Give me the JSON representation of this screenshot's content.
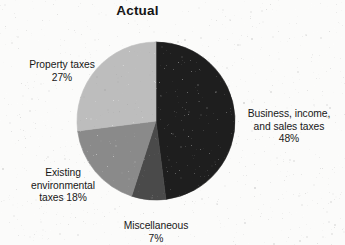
{
  "chart_title": "Actual",
  "background_color": "#fbfbfa",
  "text_color": "#171717",
  "labels": {
    "business": {
      "name": "Business, income,\nand sales taxes",
      "percent": "48%"
    },
    "miscellaneous": {
      "name": "Miscellaneous",
      "percent": "7%"
    },
    "environmental": {
      "name": "Existing\nenvironmental\ntaxes 18%",
      "percent": ""
    },
    "property": {
      "name": "Property taxes",
      "percent": "27%"
    }
  },
  "chart_data": {
    "type": "pie",
    "title": "Actual",
    "xlabel": "",
    "ylabel": "",
    "start_angle_deg": 0,
    "direction": "clockwise",
    "legend": "none",
    "grid": false,
    "labels_position": "outside",
    "categories": [
      "Business, income, and sales taxes",
      "Miscellaneous",
      "Existing environmental taxes",
      "Property taxes"
    ],
    "values": [
      48,
      7,
      18,
      27
    ],
    "value_suffix": "%",
    "colors": [
      "#1e1e1e",
      "#4a4a4a",
      "#8a8a8a",
      "#bdbdbd"
    ],
    "slices": [
      {
        "label": "Business, income, and sales taxes",
        "value": 48,
        "display": "48%",
        "color": "#1e1e1e",
        "start_deg": 0,
        "end_deg": 172.8
      },
      {
        "label": "Miscellaneous",
        "value": 7,
        "display": "7%",
        "color": "#4a4a4a",
        "start_deg": 172.8,
        "end_deg": 198.0
      },
      {
        "label": "Existing environmental taxes",
        "value": 18,
        "display": "18%",
        "color": "#8a8a8a",
        "start_deg": 198.0,
        "end_deg": 262.8
      },
      {
        "label": "Property taxes",
        "value": 27,
        "display": "27%",
        "color": "#bdbdbd",
        "start_deg": 262.8,
        "end_deg": 360.0
      }
    ],
    "geometry": {
      "center_x": 156,
      "center_y": 121,
      "radius": 79
    }
  }
}
